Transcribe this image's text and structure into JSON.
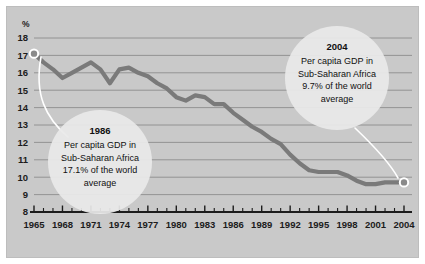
{
  "chart_data": {
    "type": "line",
    "title": "",
    "subtitle": "",
    "xlabel": "",
    "ylabel": "%",
    "ylim": [
      8,
      18
    ],
    "xlim": [
      1965,
      2004
    ],
    "grid": true,
    "legend": "none",
    "y_ticks": [
      "18",
      "17",
      "16",
      "15",
      "14",
      "13",
      "12",
      "11",
      "10",
      "9",
      "8"
    ],
    "x_ticks": [
      "1965",
      "1968",
      "1971",
      "1974",
      "1977",
      "1980",
      "1983",
      "1986",
      "1989",
      "1992",
      "1995",
      "1998",
      "2001",
      "2004"
    ],
    "x_tick_step_minor": 1,
    "x_tick_step_major": 3,
    "series": [
      {
        "name": "Per capita GDP in Sub-Saharan Africa as % of world average",
        "color": "#7a7a7a",
        "x": [
          1965,
          1966,
          1967,
          1968,
          1969,
          1970,
          1971,
          1972,
          1973,
          1974,
          1975,
          1976,
          1977,
          1978,
          1979,
          1980,
          1981,
          1982,
          1983,
          1984,
          1985,
          1986,
          1987,
          1988,
          1989,
          1990,
          1991,
          1992,
          1993,
          1994,
          1995,
          1996,
          1997,
          1998,
          1999,
          2000,
          2001,
          2002,
          2003,
          2004
        ],
        "values": [
          17.1,
          16.6,
          16.2,
          15.7,
          16.0,
          16.3,
          16.6,
          16.2,
          15.4,
          16.2,
          16.3,
          16.0,
          15.8,
          15.4,
          15.1,
          14.6,
          14.4,
          14.7,
          14.6,
          14.2,
          14.2,
          13.7,
          13.3,
          12.9,
          12.6,
          12.2,
          11.9,
          11.3,
          10.8,
          10.4,
          10.3,
          10.3,
          10.3,
          10.1,
          9.8,
          9.6,
          9.6,
          9.7,
          9.7,
          9.7
        ]
      }
    ],
    "annotations": [
      {
        "id": "left-callout",
        "title": "1986",
        "lines": [
          "Per capita GDP in",
          "Sub-Saharan Africa",
          "17.1% of the world",
          "average"
        ],
        "points_to_year": 1965,
        "points_to_value": 17.1
      },
      {
        "id": "right-callout",
        "title": "2004",
        "lines": [
          "Per capita GDP in",
          "Sub-Saharan Africa",
          "9.7% of the world",
          "average"
        ],
        "points_to_year": 2004,
        "points_to_value": 9.7
      }
    ],
    "colors": {
      "panel_background": "#c9c9c9",
      "line": "#7a7a7a",
      "gridline": "#8d8d8d",
      "axis": "#1c1c1c",
      "callout_bubble": "#e9e9e9",
      "leader_line": "#ffffff",
      "text": "#101010"
    }
  }
}
